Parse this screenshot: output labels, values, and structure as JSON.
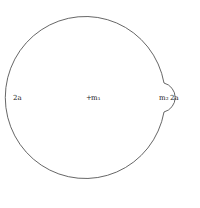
{
  "diagram": {
    "large_sphere": {
      "label": "m₁",
      "marker": "+",
      "edge_label_left": "2a"
    },
    "small_sphere": {
      "label": "m₂",
      "edge_label": "2a"
    },
    "colors": {
      "stroke": "#555555",
      "text": "#222222",
      "background": "#ffffff"
    }
  }
}
